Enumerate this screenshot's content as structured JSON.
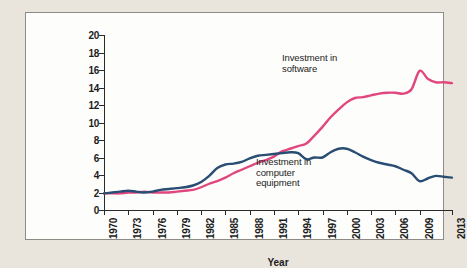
{
  "figure": {
    "background_color": "#e9e5dd",
    "panel_color": "#fdfdfb",
    "border_color": "#8e8b84"
  },
  "axes": {
    "y_title": "Share of private nonresidential investment (%)",
    "x_title": "Year"
  },
  "annotations": {
    "software": "Investment in\nsoftware",
    "computer_equipment": "Investment in\ncomputer\nequipment"
  },
  "chart_data": {
    "type": "line",
    "title": "",
    "xlabel": "Year",
    "ylabel": "Share of private nonresidential investment (%)",
    "xlim": [
      1970,
      2013
    ],
    "ylim": [
      0,
      20
    ],
    "ytick_step": 2,
    "xtick_step": 3,
    "grid": false,
    "legend": "inline-annotations",
    "yticks": [
      0,
      2,
      4,
      6,
      8,
      10,
      12,
      14,
      16,
      18,
      20
    ],
    "xticks": [
      1970,
      1973,
      1976,
      1979,
      1982,
      1985,
      1988,
      1991,
      1994,
      1997,
      2000,
      2003,
      2006,
      2009,
      2013
    ],
    "x": [
      1970,
      1971,
      1972,
      1973,
      1974,
      1975,
      1976,
      1977,
      1978,
      1979,
      1980,
      1981,
      1982,
      1983,
      1984,
      1985,
      1986,
      1987,
      1988,
      1989,
      1990,
      1991,
      1992,
      1993,
      1994,
      1995,
      1996,
      1997,
      1998,
      1999,
      2000,
      2001,
      2002,
      2003,
      2004,
      2005,
      2006,
      2007,
      2008,
      2009,
      2010,
      2011,
      2012,
      2013
    ],
    "series": [
      {
        "name": "Investment in software",
        "color": "#e0477e",
        "values": [
          1.9,
          1.9,
          1.9,
          2.0,
          2.0,
          2.1,
          2.0,
          2.0,
          2.0,
          2.1,
          2.2,
          2.3,
          2.6,
          3.0,
          3.3,
          3.7,
          4.2,
          4.6,
          5.0,
          5.4,
          5.7,
          6.1,
          6.7,
          7.0,
          7.3,
          7.6,
          8.5,
          9.5,
          10.6,
          11.5,
          12.3,
          12.8,
          12.9,
          13.1,
          13.3,
          13.4,
          13.4,
          13.3,
          13.8,
          15.9,
          15.0,
          14.6,
          14.6,
          14.5
        ]
      },
      {
        "name": "Investment in computer equipment",
        "color": "#2a4d73",
        "values": [
          1.9,
          2.0,
          2.1,
          2.2,
          2.1,
          2.0,
          2.1,
          2.3,
          2.4,
          2.5,
          2.6,
          2.8,
          3.2,
          3.9,
          4.8,
          5.2,
          5.3,
          5.5,
          5.9,
          6.2,
          6.3,
          6.4,
          6.5,
          6.6,
          6.5,
          5.8,
          6.0,
          6.0,
          6.6,
          7.0,
          7.0,
          6.6,
          6.1,
          5.7,
          5.4,
          5.2,
          5.0,
          4.6,
          4.2,
          3.3,
          3.6,
          3.9,
          3.8,
          3.7
        ]
      }
    ]
  }
}
